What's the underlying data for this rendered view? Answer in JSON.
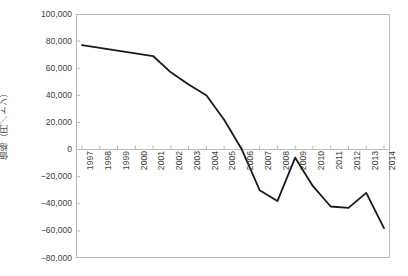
{
  "chart_data": {
    "type": "line",
    "title": "",
    "xlabel": "",
    "ylabel": "価格（円／トン）",
    "ylim": [
      -80000,
      100000
    ],
    "ytick_step": 20000,
    "grid": false,
    "legend": null,
    "line_color": "#1a1a1a",
    "frame_color": "#b9b9b9",
    "categories": [
      "1997",
      "1998",
      "1999",
      "2000",
      "2001",
      "2002",
      "2003",
      "2004",
      "2005",
      "2006",
      "2007",
      "2008",
      "2009",
      "2010",
      "2011",
      "2012",
      "2013",
      "2014"
    ],
    "values": [
      77000,
      75000,
      73000,
      71000,
      69000,
      57000,
      48000,
      40000,
      22000,
      0,
      -30000,
      -38000,
      -6000,
      -27000,
      -42000,
      -43000,
      -32000,
      -58000
    ],
    "ytick_labels": [
      "100,000",
      "80,000",
      "60,000",
      "40,000",
      "20,000",
      "0",
      "−20,000",
      "−40,000",
      "−60,000",
      "−80,000"
    ],
    "ytick_values": [
      100000,
      80000,
      60000,
      40000,
      20000,
      0,
      -20000,
      -40000,
      -60000,
      -80000
    ]
  }
}
